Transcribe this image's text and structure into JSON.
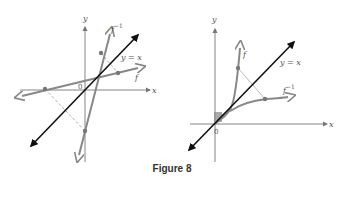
{
  "figure": {
    "caption": "Figure 8",
    "colors": {
      "axis": "#777777",
      "identity_line": "#111111",
      "function": "#808080",
      "dashed": "#999999"
    }
  },
  "left_graph": {
    "labels": {
      "y_axis": "y",
      "x_axis": "x",
      "origin": "0",
      "identity": "y = x",
      "f": "f",
      "f_inverse": "f",
      "f_inverse_sup": "−1"
    }
  },
  "right_graph": {
    "labels": {
      "y_axis": "y",
      "x_axis": "x",
      "origin": "0",
      "identity": "y = x",
      "f": "f",
      "f_inverse": "f",
      "f_inverse_sup": "−1"
    }
  }
}
